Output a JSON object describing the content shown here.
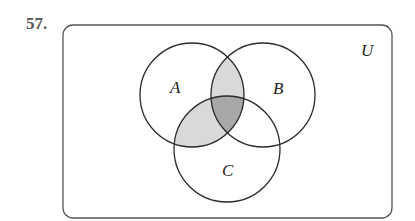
{
  "problem": {
    "number": "57."
  },
  "diagram": {
    "type": "venn",
    "universe_label": "U",
    "sets": [
      {
        "name": "A",
        "label": "A"
      },
      {
        "name": "B",
        "label": "B"
      },
      {
        "name": "C",
        "label": "C"
      }
    ],
    "shaded_regions": [
      {
        "region": "A∩B only",
        "shade": "light",
        "color": "#d9d9d9"
      },
      {
        "region": "A∩C only",
        "shade": "light",
        "color": "#d9d9d9"
      },
      {
        "region": "A∩B∩C",
        "shade": "dark",
        "color": "#a8a8a8"
      }
    ],
    "colors": {
      "stroke": "#2a2a2a",
      "border": "#555555",
      "light": "#d9d9d9",
      "dark": "#a8a8a8"
    }
  }
}
